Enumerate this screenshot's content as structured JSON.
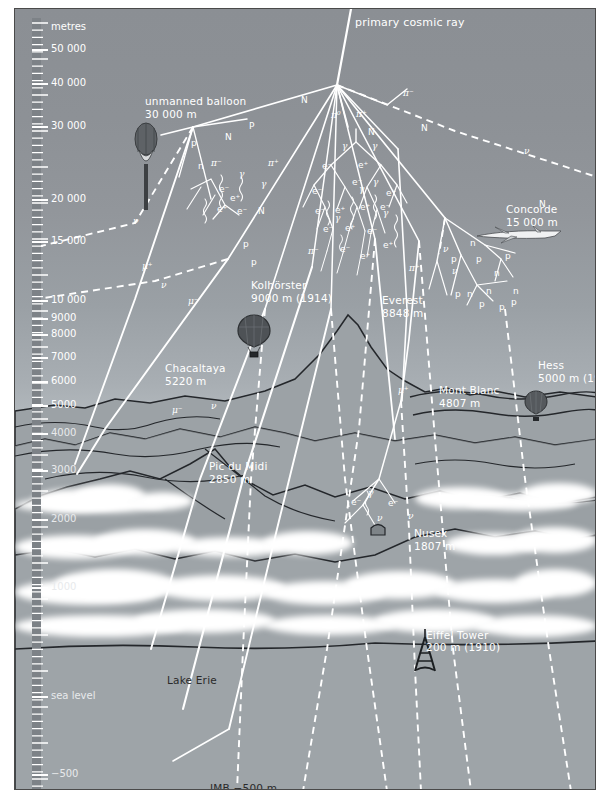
{
  "figure": {
    "axis_title": "metres",
    "source_label": "primary cosmic ray"
  },
  "colors": {
    "sky_top": "#8b8f94",
    "sky_horizon": "#e2e6e8",
    "ground": "#9ba1a5",
    "strata_dark": "#8a9095",
    "strata_light": "#b9bec2",
    "ray": "#ffffff",
    "outline": "#2a2a2a",
    "scalebar": "#7d8287"
  },
  "scale": {
    "unit": "metres",
    "labels": [
      {
        "text": "metres",
        "y": 18,
        "header": true
      },
      {
        "text": "50 000",
        "y": 40
      },
      {
        "text": "40 000",
        "y": 74
      },
      {
        "text": "30 000",
        "y": 117
      },
      {
        "text": "20 000",
        "y": 190
      },
      {
        "text": "15 000",
        "y": 232
      },
      {
        "text": "10 000",
        "y": 291
      },
      {
        "text": "9000",
        "y": 309
      },
      {
        "text": "8000",
        "y": 325
      },
      {
        "text": "7000",
        "y": 348
      },
      {
        "text": "6000",
        "y": 372
      },
      {
        "text": "5000",
        "y": 396
      },
      {
        "text": "4000",
        "y": 424
      },
      {
        "text": "3000",
        "y": 461
      },
      {
        "text": "2000",
        "y": 510
      },
      {
        "text": "1000",
        "y": 578
      },
      {
        "text": "sea level",
        "y": 687
      },
      {
        "text": "−500",
        "y": 765
      }
    ]
  },
  "landmarks": [
    {
      "name": "unmanned-balloon",
      "lines": [
        "unmanned balloon",
        "30 000 m"
      ],
      "x": 130,
      "y": 86
    },
    {
      "name": "concorde",
      "lines": [
        "Concorde",
        "15 000 m"
      ],
      "x": 491,
      "y": 194
    },
    {
      "name": "kolhorster",
      "lines": [
        "Kolhörster",
        "9000 m (1914)"
      ],
      "x": 236,
      "y": 270
    },
    {
      "name": "everest",
      "lines": [
        "Everest",
        "8848 m"
      ],
      "x": 367,
      "y": 285
    },
    {
      "name": "chacaltaya",
      "lines": [
        "Chacaltaya",
        "5220 m"
      ],
      "x": 150,
      "y": 353
    },
    {
      "name": "hess",
      "lines": [
        "Hess",
        "5000 m (1912)"
      ],
      "x": 523,
      "y": 350
    },
    {
      "name": "mont-blanc",
      "lines": [
        "Mont Blanc",
        "4807 m"
      ],
      "x": 424,
      "y": 375
    },
    {
      "name": "pic-du-midi",
      "lines": [
        "Pic du Midi",
        "2850 m"
      ],
      "x": 194,
      "y": 451
    },
    {
      "name": "nusex",
      "lines": [
        "Nusex",
        "1807 m"
      ],
      "x": 399,
      "y": 518
    },
    {
      "name": "wulf-eiffel-tower",
      "lines": [
        "Wulf",
        "Eiffel Tower",
        "200 m (1910)"
      ],
      "x": 411,
      "y": 607
    },
    {
      "name": "lake-erie",
      "lines": [
        "Lake Erie"
      ],
      "x": 152,
      "y": 665,
      "dark": true
    },
    {
      "name": "imb",
      "lines": [
        "IMB −500 m"
      ],
      "x": 195,
      "y": 773,
      "dark": true
    }
  ],
  "particles": [
    {
      "t": "P",
      "x": 234,
      "y": 113,
      "i": false
    },
    {
      "t": "N",
      "x": 210,
      "y": 124,
      "i": false
    },
    {
      "t": "N",
      "x": 286,
      "y": 87,
      "i": false
    },
    {
      "t": "N",
      "x": 353,
      "y": 119,
      "i": false
    },
    {
      "t": "N",
      "x": 406,
      "y": 115,
      "i": false
    },
    {
      "t": "N",
      "x": 243,
      "y": 198,
      "i": false
    },
    {
      "t": "N",
      "x": 524,
      "y": 191,
      "i": false
    },
    {
      "t": "p",
      "x": 176,
      "y": 130,
      "i": false
    },
    {
      "t": "n",
      "x": 183,
      "y": 153,
      "i": false
    },
    {
      "t": "π⁺",
      "x": 253,
      "y": 150,
      "i": true
    },
    {
      "t": "π⁻",
      "x": 196,
      "y": 150,
      "i": true
    },
    {
      "t": "π⁰",
      "x": 316,
      "y": 102,
      "i": true
    },
    {
      "t": "π⁺",
      "x": 341,
      "y": 101,
      "i": true
    },
    {
      "t": "π⁻",
      "x": 388,
      "y": 80,
      "i": true
    },
    {
      "t": "π⁻",
      "x": 293,
      "y": 238,
      "i": true
    },
    {
      "t": "π⁺",
      "x": 394,
      "y": 255,
      "i": true
    },
    {
      "t": "γ",
      "x": 327,
      "y": 133,
      "i": true
    },
    {
      "t": "γ",
      "x": 357,
      "y": 133,
      "i": true
    },
    {
      "t": "γ",
      "x": 224,
      "y": 161,
      "i": true
    },
    {
      "t": "γ",
      "x": 246,
      "y": 171,
      "i": true
    },
    {
      "t": "γ",
      "x": 344,
      "y": 176,
      "i": true
    },
    {
      "t": "γ",
      "x": 358,
      "y": 169,
      "i": true
    },
    {
      "t": "γ",
      "x": 368,
      "y": 200,
      "i": true
    },
    {
      "t": "γ",
      "x": 320,
      "y": 205,
      "i": true
    },
    {
      "t": "γ",
      "x": 353,
      "y": 480,
      "i": true
    },
    {
      "t": "e⁻",
      "x": 307,
      "y": 153,
      "i": false
    },
    {
      "t": "e⁺",
      "x": 343,
      "y": 152,
      "i": false
    },
    {
      "t": "e⁻",
      "x": 337,
      "y": 169,
      "i": false
    },
    {
      "t": "e⁻",
      "x": 297,
      "y": 178,
      "i": false
    },
    {
      "t": "e⁺",
      "x": 371,
      "y": 180,
      "i": false
    },
    {
      "t": "e⁻",
      "x": 300,
      "y": 198,
      "i": false
    },
    {
      "t": "e⁺",
      "x": 320,
      "y": 197,
      "i": false
    },
    {
      "t": "e⁺",
      "x": 345,
      "y": 194,
      "i": false
    },
    {
      "t": "e⁻",
      "x": 365,
      "y": 194,
      "i": false
    },
    {
      "t": "e⁻",
      "x": 308,
      "y": 216,
      "i": false
    },
    {
      "t": "e⁺",
      "x": 330,
      "y": 215,
      "i": false
    },
    {
      "t": "e⁻",
      "x": 352,
      "y": 218,
      "i": false
    },
    {
      "t": "e⁺",
      "x": 368,
      "y": 232,
      "i": false
    },
    {
      "t": "e⁻",
      "x": 325,
      "y": 236,
      "i": false
    },
    {
      "t": "e⁺",
      "x": 345,
      "y": 243,
      "i": false
    },
    {
      "t": "e⁻",
      "x": 204,
      "y": 176,
      "i": false
    },
    {
      "t": "e⁺",
      "x": 215,
      "y": 185,
      "i": false
    },
    {
      "t": "e⁻",
      "x": 222,
      "y": 198,
      "i": false
    },
    {
      "t": "e⁺",
      "x": 202,
      "y": 196,
      "i": false
    },
    {
      "t": "e⁻",
      "x": 336,
      "y": 489,
      "i": false
    },
    {
      "t": "e⁻",
      "x": 373,
      "y": 490,
      "i": false
    },
    {
      "t": "p",
      "x": 228,
      "y": 231,
      "i": false
    },
    {
      "t": "p",
      "x": 236,
      "y": 249,
      "i": false
    },
    {
      "t": "n",
      "x": 455,
      "y": 230,
      "i": false
    },
    {
      "t": "p",
      "x": 436,
      "y": 246,
      "i": false
    },
    {
      "t": "p",
      "x": 461,
      "y": 246,
      "i": false
    },
    {
      "t": "p",
      "x": 490,
      "y": 243,
      "i": false
    },
    {
      "t": "n",
      "x": 479,
      "y": 260,
      "i": false
    },
    {
      "t": "p",
      "x": 440,
      "y": 281,
      "i": false
    },
    {
      "t": "n",
      "x": 452,
      "y": 281,
      "i": false
    },
    {
      "t": "n",
      "x": 471,
      "y": 278,
      "i": false
    },
    {
      "t": "n",
      "x": 498,
      "y": 278,
      "i": false
    },
    {
      "t": "p",
      "x": 464,
      "y": 291,
      "i": false
    },
    {
      "t": "p",
      "x": 484,
      "y": 294,
      "i": false
    },
    {
      "t": "p",
      "x": 496,
      "y": 289,
      "i": false
    },
    {
      "t": "μ⁺",
      "x": 127,
      "y": 253,
      "i": true
    },
    {
      "t": "μ⁻",
      "x": 173,
      "y": 288,
      "i": true
    },
    {
      "t": "μ⁻",
      "x": 157,
      "y": 397,
      "i": true
    },
    {
      "t": "μ⁺",
      "x": 383,
      "y": 377,
      "i": true
    },
    {
      "t": "ν",
      "x": 118,
      "y": 208,
      "i": true
    },
    {
      "t": "ν",
      "x": 146,
      "y": 272,
      "i": true
    },
    {
      "t": "ν",
      "x": 196,
      "y": 393,
      "i": true
    },
    {
      "t": "ν",
      "x": 428,
      "y": 236,
      "i": true
    },
    {
      "t": "ν",
      "x": 437,
      "y": 258,
      "i": true
    },
    {
      "t": "ν",
      "x": 509,
      "y": 138,
      "i": true
    },
    {
      "t": "ν",
      "x": 362,
      "y": 505,
      "i": true
    },
    {
      "t": "ν",
      "x": 393,
      "y": 503,
      "i": true
    }
  ]
}
